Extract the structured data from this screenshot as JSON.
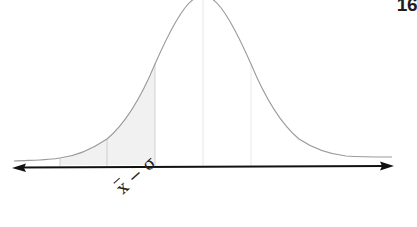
{
  "page": {
    "number": "16"
  },
  "diagram": {
    "type": "normal-distribution-curve",
    "axis": {
      "arrows": "both-ends",
      "color": "#111111"
    },
    "curve_color": "#9a9a9a",
    "shaded_region_color": "#f1f1f1",
    "vertical_markers": [
      "mean-3σ",
      "mean-2σ",
      "mean-σ",
      "mean",
      "mean+σ"
    ],
    "label": {
      "variable": "x",
      "operator": "−",
      "term": "σ"
    }
  }
}
